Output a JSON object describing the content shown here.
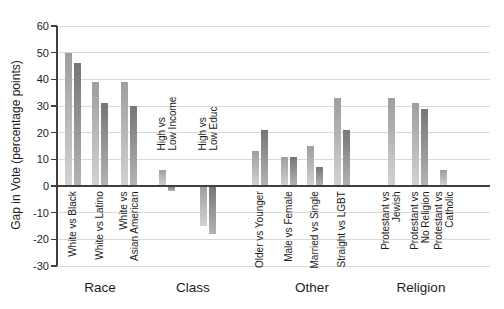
{
  "chart_data": {
    "type": "bar",
    "title": "",
    "ylabel": "Gap in Vote (percentage points)",
    "ylim": [
      -30,
      60
    ],
    "ytick_step": 10,
    "grid": true,
    "legend": "none",
    "series_names": [
      "light",
      "dark"
    ],
    "groups": [
      {
        "label": "Race",
        "labels_position": "below",
        "items": [
          {
            "label_lines": [
              "White vs Black"
            ],
            "values": [
              50,
              46
            ]
          },
          {
            "label_lines": [
              "White vs Latino"
            ],
            "values": [
              39,
              31
            ]
          },
          {
            "label_lines": [
              "White vs",
              "Asian American"
            ],
            "values": [
              39,
              30
            ]
          }
        ]
      },
      {
        "label": "Class",
        "labels_position": "above",
        "items": [
          {
            "label_lines": [
              "High vs",
              "Low Income"
            ],
            "values": [
              6,
              -2
            ]
          },
          {
            "label_lines": [
              "High vs",
              "Low Educ"
            ],
            "values": [
              -15,
              -18
            ]
          }
        ]
      },
      {
        "label": "Other",
        "labels_position": "below",
        "items": [
          {
            "label_lines": [
              "Older vs Younger"
            ],
            "values": [
              13,
              21
            ]
          },
          {
            "label_lines": [
              "Male vs Female"
            ],
            "values": [
              11,
              11
            ]
          },
          {
            "label_lines": [
              "Married vs Single"
            ],
            "values": [
              15,
              7
            ]
          },
          {
            "label_lines": [
              "Straight vs LGBT"
            ],
            "values": [
              33,
              21
            ]
          }
        ]
      },
      {
        "label": "Religion",
        "labels_position": "below",
        "items": [
          {
            "label_lines": [
              "Protestant vs",
              "Jewish"
            ],
            "values": [
              33
            ]
          },
          {
            "label_lines": [
              "Protestant vs",
              "No Religion"
            ],
            "values": [
              31,
              29
            ]
          },
          {
            "label_lines": [
              "Protestant vs",
              "Catholic"
            ],
            "values": [
              6
            ]
          }
        ]
      }
    ],
    "colors": {
      "series_light_top": "#9e9e9e",
      "series_light_bottom": "#d2d2d2",
      "series_dark_top": "#767676",
      "series_dark_bottom": "#b3b3b3",
      "gridline": "#d9d9d9",
      "axis": "#3f3f3f",
      "text": "#1c1c1c"
    }
  }
}
